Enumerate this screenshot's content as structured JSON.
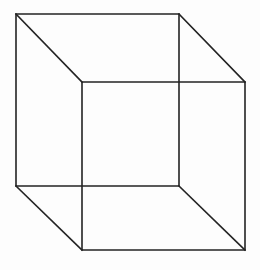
{
  "figure": {
    "name": "necker-cube",
    "background_color": "#fdfdfd",
    "line_color": "#232323",
    "line_width": 1.6,
    "canvas": {
      "width": 260,
      "height": 270
    }
  },
  "geometry": {
    "back_square": {
      "name": "back-face",
      "points": "16,14 179,14 179,186 16,186",
      "corners": {
        "top_left": [
          16,
          14
        ],
        "top_right": [
          179,
          14
        ],
        "bottom_right": [
          179,
          186
        ],
        "bottom_left": [
          16,
          186
        ]
      }
    },
    "front_square": {
      "name": "front-face",
      "points": "82,82 245,82 245,250 82,250",
      "corners": {
        "top_left": [
          82,
          82
        ],
        "top_right": [
          245,
          82
        ],
        "bottom_right": [
          245,
          250
        ],
        "bottom_left": [
          82,
          250
        ]
      }
    },
    "connectors": [
      {
        "name": "edge-top-left",
        "x1": 16,
        "y1": 14,
        "x2": 82,
        "y2": 82
      },
      {
        "name": "edge-top-right",
        "x1": 179,
        "y1": 14,
        "x2": 245,
        "y2": 82
      },
      {
        "name": "edge-bottom-right",
        "x1": 179,
        "y1": 186,
        "x2": 245,
        "y2": 250
      },
      {
        "name": "edge-bottom-left",
        "x1": 16,
        "y1": 186,
        "x2": 82,
        "y2": 250
      }
    ]
  }
}
